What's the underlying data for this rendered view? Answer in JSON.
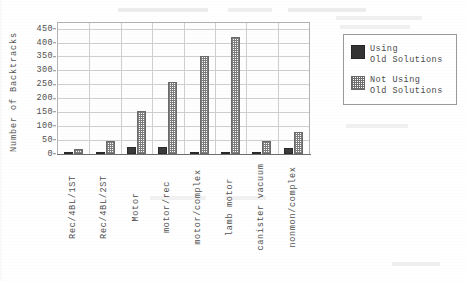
{
  "chart_data": {
    "type": "bar",
    "title": "",
    "xlabel": "",
    "ylabel": "Number of Backtracks",
    "ylim": [
      0,
      470
    ],
    "yticks": [
      0,
      50,
      100,
      150,
      200,
      250,
      300,
      350,
      400,
      450
    ],
    "grid": true,
    "legend_position": "right-outside",
    "categories": [
      "Rec/4BL/1ST",
      "Rec/4BL/2ST",
      "Motor",
      "motor/rec",
      "motor/complex",
      "lamb motor",
      "canister vacuum",
      "nonmon/complex"
    ],
    "series": [
      {
        "name": "Using Old Solutions",
        "color": "#3b3b3b",
        "pattern": "solid",
        "values": [
          5,
          5,
          25,
          25,
          8,
          8,
          5,
          22
        ]
      },
      {
        "name": "Not Using Old Solutions",
        "color": "#7d7d7d",
        "pattern": "checkered",
        "values": [
          18,
          48,
          155,
          260,
          350,
          420,
          45,
          78
        ]
      }
    ]
  },
  "legend": {
    "entries": [
      {
        "line1": "Using",
        "line2": "Old Solutions",
        "swatch": "solid-swatch-icon"
      },
      {
        "line1": "Not Using",
        "line2": "Old Solutions",
        "swatch": "checkered-swatch-icon"
      }
    ]
  },
  "scan_artifacts": {
    "top_smudges": [
      "",
      "",
      ""
    ],
    "mid_smudges": [
      "",
      ""
    ],
    "bottom_smudges": [
      ""
    ]
  }
}
